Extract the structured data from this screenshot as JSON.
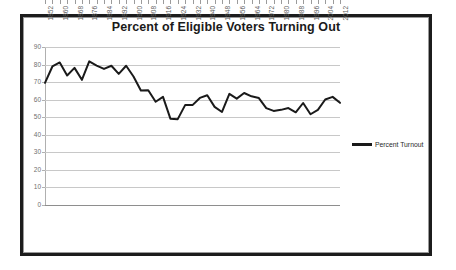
{
  "chart_data": {
    "type": "line",
    "title": "Percent of Eligible Voters Turning Out",
    "xlabel": "",
    "ylabel": "",
    "ylim": [
      0,
      90
    ],
    "ytick_values": [
      0,
      10,
      20,
      30,
      40,
      50,
      60,
      70,
      80,
      90
    ],
    "ytick_labels": [
      "0",
      "10",
      "20",
      "30",
      "40",
      "50",
      "60",
      "70",
      "80",
      "90"
    ],
    "grid": true,
    "legend_position": "right",
    "legend": [
      "Percent Turnout"
    ],
    "xtick_labels": [
      "1852",
      "1860",
      "1868",
      "1876",
      "1884",
      "1892",
      "1900",
      "1908",
      "1916",
      "1924",
      "1932",
      "1940",
      "1948",
      "1956",
      "1964",
      "1972",
      "1980",
      "1988",
      "1996",
      "2004",
      "2012"
    ],
    "x": [
      1852,
      1856,
      1860,
      1864,
      1868,
      1872,
      1876,
      1880,
      1884,
      1888,
      1892,
      1896,
      1900,
      1904,
      1908,
      1912,
      1916,
      1920,
      1924,
      1928,
      1932,
      1936,
      1940,
      1944,
      1948,
      1952,
      1956,
      1960,
      1964,
      1968,
      1972,
      1976,
      1980,
      1984,
      1988,
      1992,
      1996,
      2000,
      2004,
      2008,
      2012
    ],
    "series": [
      {
        "name": "Percent Turnout",
        "color": "#1a1a1a",
        "values": [
          69.6,
          78.9,
          81.2,
          73.8,
          78.1,
          71.3,
          81.8,
          79.4,
          77.5,
          79.3,
          74.7,
          79.3,
          73.2,
          65.2,
          65.4,
          58.8,
          61.6,
          49.2,
          48.9,
          56.9,
          56.9,
          61.0,
          62.5,
          55.9,
          53.0,
          63.3,
          60.6,
          63.8,
          61.9,
          60.9,
          55.2,
          53.6,
          54.2,
          55.2,
          52.8,
          58.1,
          51.7,
          54.2,
          60.1,
          61.6,
          58.2
        ]
      }
    ]
  },
  "legend": {
    "entries": [
      {
        "label": "Percent Turnout",
        "swatch_color": "#1a1a1a"
      }
    ]
  },
  "colors": {
    "line": "#1a1a1a",
    "gridline": "#c8c8c8",
    "axis": "#9b9b9b",
    "tick_text": "#6f6f6f",
    "frame": "#1c1c1c",
    "background": "#ffffff"
  }
}
